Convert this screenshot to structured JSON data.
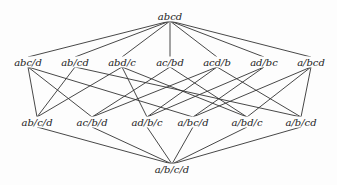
{
  "diagram": {
    "type": "partition-lattice",
    "nodes": [
      {
        "id": "abcd",
        "label": "abcd",
        "x": 170,
        "y": 16
      },
      {
        "id": "abc/d",
        "label": "abc/d",
        "x": 28,
        "y": 62
      },
      {
        "id": "ab/cd",
        "label": "ab/cd",
        "x": 75,
        "y": 62
      },
      {
        "id": "abd/c",
        "label": "abd/c",
        "x": 122,
        "y": 62
      },
      {
        "id": "ac/bd",
        "label": "ac/bd",
        "x": 170,
        "y": 62
      },
      {
        "id": "acd/b",
        "label": "acd/b",
        "x": 217,
        "y": 62
      },
      {
        "id": "ad/bc",
        "label": "ad/bc",
        "x": 264,
        "y": 62
      },
      {
        "id": "a/bcd",
        "label": "a/bcd",
        "x": 311,
        "y": 62
      },
      {
        "id": "ab/c/d",
        "label": "ab/c/d",
        "x": 37,
        "y": 122
      },
      {
        "id": "ac/b/d",
        "label": "ac/b/d",
        "x": 92,
        "y": 122
      },
      {
        "id": "ad/b/c",
        "label": "ad/b/c",
        "x": 147,
        "y": 122
      },
      {
        "id": "a/bc/d",
        "label": "a/bc/d",
        "x": 193,
        "y": 122
      },
      {
        "id": "a/bd/c",
        "label": "a/bd/c",
        "x": 247,
        "y": 122
      },
      {
        "id": "a/b/cd",
        "label": "a/b/cd",
        "x": 301,
        "y": 122
      },
      {
        "id": "a/b/c/d",
        "label": "a/b/c/d",
        "x": 172,
        "y": 169
      }
    ],
    "edges": [
      [
        "abcd",
        "abc/d"
      ],
      [
        "abcd",
        "ab/cd"
      ],
      [
        "abcd",
        "abd/c"
      ],
      [
        "abcd",
        "ac/bd"
      ],
      [
        "abcd",
        "acd/b"
      ],
      [
        "abcd",
        "ad/bc"
      ],
      [
        "abcd",
        "a/bcd"
      ],
      [
        "abc/d",
        "ab/c/d"
      ],
      [
        "abc/d",
        "ac/b/d"
      ],
      [
        "abc/d",
        "a/bc/d"
      ],
      [
        "ab/cd",
        "ab/c/d"
      ],
      [
        "ab/cd",
        "a/b/cd"
      ],
      [
        "abd/c",
        "ab/c/d"
      ],
      [
        "abd/c",
        "ad/b/c"
      ],
      [
        "abd/c",
        "a/bd/c"
      ],
      [
        "ac/bd",
        "ac/b/d"
      ],
      [
        "ac/bd",
        "a/bd/c"
      ],
      [
        "acd/b",
        "ac/b/d"
      ],
      [
        "acd/b",
        "ad/b/c"
      ],
      [
        "acd/b",
        "a/b/cd"
      ],
      [
        "ad/bc",
        "ad/b/c"
      ],
      [
        "ad/bc",
        "a/bc/d"
      ],
      [
        "a/bcd",
        "a/bc/d"
      ],
      [
        "a/bcd",
        "a/bd/c"
      ],
      [
        "a/bcd",
        "a/b/cd"
      ],
      [
        "ab/c/d",
        "a/b/c/d"
      ],
      [
        "ac/b/d",
        "a/b/c/d"
      ],
      [
        "ad/b/c",
        "a/b/c/d"
      ],
      [
        "a/bc/d",
        "a/b/c/d"
      ],
      [
        "a/bd/c",
        "a/b/c/d"
      ],
      [
        "a/b/cd",
        "a/b/c/d"
      ]
    ],
    "line_color": "#333333"
  }
}
